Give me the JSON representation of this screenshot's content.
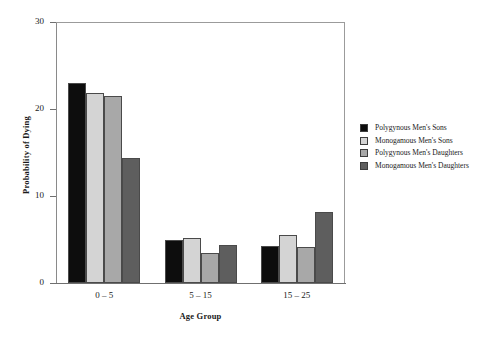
{
  "chart_data": {
    "type": "bar",
    "title": "",
    "xlabel": "Age Group",
    "ylabel": "Probability of Dying",
    "categories": [
      "0 – 5",
      "5 – 15",
      "15 – 25"
    ],
    "series": [
      {
        "name": "Polygynous Men's Sons",
        "color": "#0d0d0d",
        "values": [
          23.0,
          5.0,
          4.2
        ]
      },
      {
        "name": "Monogamous Men's Sons",
        "color": "#d4d4d4",
        "values": [
          21.8,
          5.2,
          5.5
        ]
      },
      {
        "name": "Polygynous Men's Daughters",
        "color": "#a8a8a8",
        "values": [
          21.5,
          3.4,
          4.1
        ]
      },
      {
        "name": "Monogamous Men's Daughters",
        "color": "#5e5e5e",
        "values": [
          14.4,
          4.4,
          8.2
        ]
      }
    ],
    "ylim": [
      0,
      30
    ],
    "yticks": [
      0,
      10,
      20,
      30
    ],
    "ytick_labels": [
      "0",
      "10",
      "20",
      "30"
    ],
    "grid": false,
    "legend_position": "right-outside",
    "frame_color": "#9b9b9b",
    "axis_color": "#6f6f6f"
  }
}
